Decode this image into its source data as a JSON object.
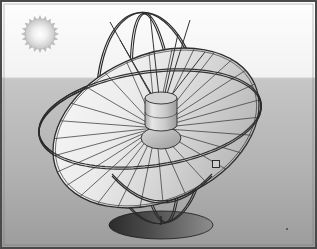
{
  "scene": {
    "title": "Solar parabolic dish concentrator on gimbal mount",
    "kind": "technical-illustration",
    "width": 317,
    "height": 249
  },
  "frame": {
    "border_color": "#4a4a4a",
    "border_width": 2,
    "inner_outline_color": "#6e6e6e"
  },
  "background": {
    "sky_color": "#fdfdfd",
    "sky_color_low": "#f2f2f2",
    "ground_color_top": "#c6c6c6",
    "ground_color_bottom": "#9c9c9c",
    "horizon_y": 78,
    "horizon_line_color": "#cfcfcf"
  },
  "sun": {
    "name": "sun",
    "center_x": 40,
    "center_y": 34,
    "core_radius": 15,
    "spike_radius": 19,
    "spike_count": 20,
    "core_color_center": "#ffffff",
    "core_color_edge": "#c8c8c8",
    "spike_color": "#bdbdbd"
  },
  "dish": {
    "name": "parabolic-dish",
    "center_x": 156,
    "center_y": 128,
    "rim_rx": 108,
    "rim_ry": 73,
    "rotation_deg": -24,
    "rib_count": 28,
    "face_color_light": "#f4f4f4",
    "face_color_mid": "#d8d8d8",
    "face_color_dark": "#b4b4b4",
    "rib_color": "#3c3c3c",
    "rim_color": "#2e2e2e",
    "rim_width": 1.3
  },
  "receiver": {
    "name": "receiver-cylinder",
    "center_x": 161,
    "top_y": 98,
    "width": 32,
    "height": 27,
    "cap_ry": 6,
    "body_color_light": "#e6e6e6",
    "body_color_dark": "#9b9b9b",
    "cap_color": "#d2d2d2",
    "outline_color": "#2b2b2b",
    "band_y_offset": 14
  },
  "hub": {
    "name": "dish-hub-dome",
    "center_x": 161,
    "center_y": 138,
    "rx": 20,
    "ry": 11,
    "color_light": "#d9d9d9",
    "color_dark": "#9a9a9a",
    "outline_color": "#2b2b2b"
  },
  "gimbal": {
    "name": "gimbal-ring-assembly",
    "ring_color": "#2a2a2a",
    "ring_width": 1.2,
    "tube_gap": 2.0,
    "outer_ring": {
      "name": "outer-gimbal-ring",
      "cx": 150,
      "cy": 118,
      "rx": 112,
      "ry": 112,
      "squash": 0.42,
      "tilt_deg": -8
    },
    "meridian_ring": {
      "name": "meridian-gimbal-ring",
      "cx": 150,
      "cy": 118,
      "rx": 106,
      "ry": 106
    },
    "pivot": {
      "name": "gimbal-pivot-joint",
      "x": 216,
      "y": 164,
      "size": 7,
      "color": "#cfcfcf",
      "outline_color": "#1f1f1f"
    }
  },
  "struts": {
    "name": "receiver-support-struts",
    "color": "#333333",
    "width": 1.0,
    "count": 6
  },
  "yoke": {
    "name": "support-yoke",
    "color": "#2a2a2a",
    "width": 1.2,
    "apex_x": 161,
    "apex_y": 222,
    "left_x": 112,
    "right_x": 212,
    "top_y": 176
  },
  "base": {
    "name": "base-platform",
    "center_x": 161,
    "center_y": 225,
    "rx": 52,
    "ry": 14,
    "color_left": "#2b2b2b",
    "color_right": "#8e8e8e",
    "outline_color": "#1a1a1a"
  },
  "speck": {
    "name": "image-artifact-speck",
    "x": 286,
    "y": 228,
    "size": 2,
    "color": "#5a5a5a"
  },
  "labels": {
    "alt_text": "Illustration of a gimbal-mounted parabolic solar dish concentrator with a cylindrical receiver at the focus, standing on an elliptical base under a stylized sun."
  }
}
